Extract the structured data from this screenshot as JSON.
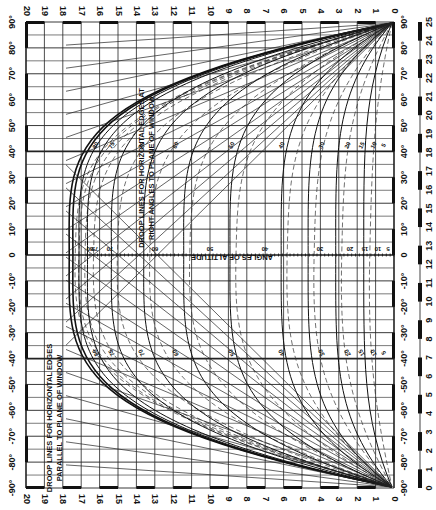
{
  "diagram": {
    "title_right_angles": [
      "DROOP LINES FOR HORIZONTAL EDGES AT",
      "RIGHT ANGLES TO PLANE OF WINDOW"
    ],
    "title_parallel": [
      "DROOP LINES FOR HORIZONTAL EDGES",
      "PARALLEL TO PLANE OF WINDOW"
    ],
    "center_axis_label": "ANGLES OF ALTITUDE",
    "top_scale": [
      "20",
      "19",
      "18",
      "17",
      "16",
      "15",
      "14",
      "13",
      "12",
      "11",
      "10",
      "9",
      "8",
      "7",
      "6",
      "5",
      "4",
      "3",
      "2",
      "1",
      "0"
    ],
    "bottom_scale": [
      "20",
      "19",
      "18",
      "17",
      "16",
      "15",
      "14",
      "13",
      "12",
      "11",
      "10",
      "9",
      "8",
      "7",
      "6",
      "5",
      "4",
      "3",
      "2",
      "1",
      "0"
    ],
    "side_angle_scale": [
      "90°",
      "80°",
      "70°",
      "60°",
      "50°",
      "40°",
      "30°",
      "20°",
      "10°",
      "0",
      "-10°",
      "-20°",
      "-30°",
      "-40°",
      "-50°",
      "-60°",
      "-70°",
      "-80°",
      "-90°"
    ],
    "far_right_scale": [
      "25",
      "24",
      "23",
      "22",
      "21",
      "20",
      "19",
      "18",
      "17",
      "16",
      "15",
      "14",
      "13",
      "12",
      "11",
      "10",
      "9",
      "8",
      "7",
      "6",
      "5",
      "4",
      "3",
      "2",
      "1",
      "0"
    ],
    "center_altitude_labels": [
      "80",
      "75",
      "70",
      "60",
      "50",
      "40",
      "30",
      "20",
      "15",
      "10",
      "5"
    ],
    "curve_labels_upper": [
      "80",
      "75",
      "70",
      "60",
      "50",
      "40",
      "30",
      "20",
      "15",
      "10",
      "5"
    ],
    "curve_labels_lower": [
      "80",
      "75",
      "70",
      "60",
      "50",
      "40",
      "30",
      "20",
      "15",
      "10",
      "5"
    ],
    "colors": {
      "ink": "#111111",
      "paper": "#ffffff",
      "grid": "#222222"
    }
  }
}
